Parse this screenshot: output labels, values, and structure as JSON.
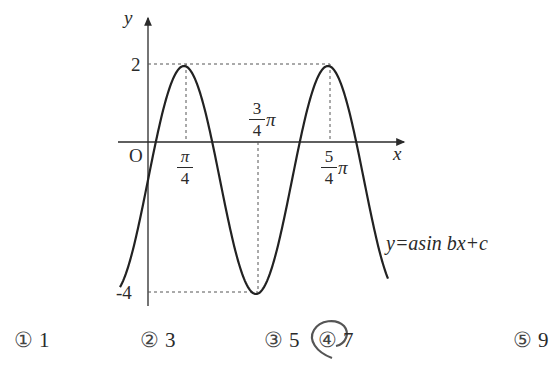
{
  "chart_data": {
    "type": "line",
    "title": "",
    "equation_label": "y=asin bx+c",
    "xlabel": "x",
    "ylabel": "y",
    "origin_label": "O",
    "function": {
      "a": 3,
      "b": 2,
      "c": -1,
      "form": "y = a sin bx + c"
    },
    "y_ticks": [
      {
        "value": 2,
        "label": "2"
      },
      {
        "value": -4,
        "label": "-4"
      }
    ],
    "x_ticks": [
      {
        "value": "π/4",
        "numerator": "π",
        "denominator": "4",
        "suffix": ""
      },
      {
        "value": "3π/4",
        "numerator": "3",
        "denominator": "4",
        "suffix": "π"
      },
      {
        "value": "5π/4",
        "numerator": "5",
        "denominator": "4",
        "suffix": "π"
      }
    ],
    "key_points": [
      {
        "x": "π/4",
        "y": 2,
        "type": "maximum"
      },
      {
        "x": "3π/4",
        "y": -4,
        "type": "minimum"
      },
      {
        "x": "5π/4",
        "y": 2,
        "type": "maximum"
      }
    ],
    "max": 2,
    "min": -4,
    "period": "π",
    "grid": false,
    "dashed_guides": true
  },
  "choices": [
    {
      "number": "①",
      "value": "1",
      "selected": false
    },
    {
      "number": "②",
      "value": "3",
      "selected": false
    },
    {
      "number": "③",
      "value": "5",
      "selected": false
    },
    {
      "number": "④",
      "value": "7",
      "selected": true
    },
    {
      "number": "⑤",
      "value": "9",
      "selected": false
    }
  ]
}
